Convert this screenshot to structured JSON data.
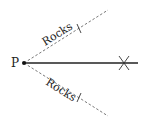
{
  "diagram": {
    "point_label": "P",
    "upper_boundary_label": "Rocks",
    "lower_boundary_label": "Rocks",
    "colors": {
      "line": "#222222",
      "dashed": "#555555",
      "background": "#ffffff"
    },
    "elements": {
      "origin_point": {
        "x": 24,
        "y": 63
      },
      "main_path_end": {
        "x": 138,
        "y": 63
      },
      "cross_marker": {
        "x": 124,
        "y": 63
      },
      "upper_dashed_end": {
        "x": 108,
        "y": 10
      },
      "lower_dashed_end": {
        "x": 108,
        "y": 116
      }
    }
  }
}
